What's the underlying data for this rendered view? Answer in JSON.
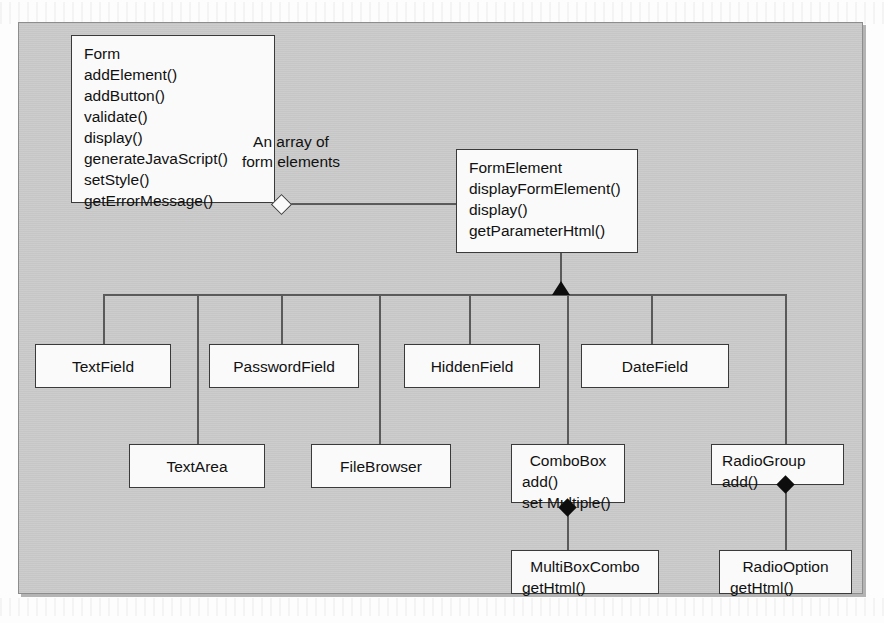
{
  "diagram": {
    "title_visible": false,
    "background_color": "#c9c9c9",
    "box_fill": "#fafafa",
    "box_border": "#3a3a3a",
    "line_color": "#5a5a5a",
    "marker_color": "#0d0d0d",
    "association_label": "An array of\nform elements",
    "association_label_line1": "An array of",
    "association_label_line2": "form elements"
  },
  "classes": {
    "form": {
      "name": "Form",
      "methods": [
        "addElement()",
        "addButton()",
        "validate()",
        "display()",
        "generateJavaScript()",
        "setStyle()",
        "getErrorMessage()"
      ]
    },
    "form_element": {
      "name": "FormElement",
      "methods": [
        "displayFormElement()",
        "display()",
        "getParameterHtml()"
      ]
    },
    "text_field": {
      "name": "TextField",
      "methods": []
    },
    "password_field": {
      "name": "PasswordField",
      "methods": []
    },
    "hidden_field": {
      "name": "HiddenField",
      "methods": []
    },
    "date_field": {
      "name": "DateField",
      "methods": []
    },
    "text_area": {
      "name": "TextArea",
      "methods": []
    },
    "file_browser": {
      "name": "FileBrowser",
      "methods": []
    },
    "combo_box": {
      "name": "ComboBox",
      "methods": [
        "add()",
        "set Multiple()"
      ]
    },
    "radio_group": {
      "name": "RadioGroup",
      "methods": [
        "add()"
      ]
    },
    "multi_box_combo": {
      "name": "MultiBoxCombo",
      "methods": [
        "getHtml()"
      ]
    },
    "radio_option": {
      "name": "RadioOption",
      "methods": [
        "getHtml()"
      ]
    }
  }
}
